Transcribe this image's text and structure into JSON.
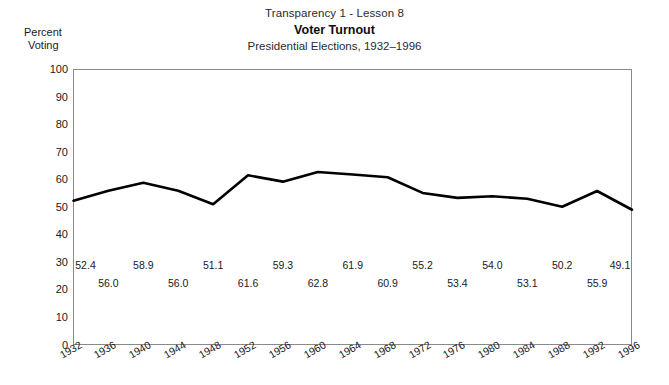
{
  "titles": {
    "line1": "Transparency 1 - Lesson 8",
    "line2": "Voter Turnout",
    "line3": "Presidential Elections, 1932–1996"
  },
  "axis_caption": {
    "line1": "Percent",
    "line2": "Voting"
  },
  "chart_data": {
    "type": "line",
    "title": "Voter Turnout",
    "subtitle": "Presidential Elections, 1932–1996",
    "supertitle": "Transparency 1 - Lesson 8",
    "xlabel": "",
    "ylabel": "Percent Voting",
    "ylim": [
      0,
      100
    ],
    "yticks": [
      0,
      10,
      20,
      30,
      40,
      50,
      60,
      70,
      80,
      90,
      100
    ],
    "grid": false,
    "legend": "none",
    "line_color": "#000000",
    "categories": [
      "1932",
      "1936",
      "1940",
      "1944",
      "1948",
      "1952",
      "1956",
      "1960",
      "1964",
      "1968",
      "1972",
      "1976",
      "1980",
      "1984",
      "1988",
      "1992",
      "1996"
    ],
    "values": [
      52.4,
      56.0,
      58.9,
      56.0,
      51.1,
      61.6,
      59.3,
      62.8,
      61.9,
      60.9,
      55.2,
      53.4,
      54.0,
      53.1,
      50.2,
      55.9,
      49.1
    ],
    "value_labels": [
      "52.4",
      "56.0",
      "58.9",
      "56.0",
      "51.1",
      "61.6",
      "59.3",
      "62.8",
      "61.9",
      "60.9",
      "55.2",
      "53.4",
      "54.0",
      "53.1",
      "50.2",
      "55.9",
      "49.1"
    ]
  }
}
